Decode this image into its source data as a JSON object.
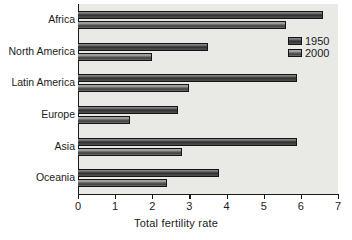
{
  "chart_data": {
    "type": "bar",
    "orientation": "horizontal",
    "title": "",
    "xlabel": "Total fertility rate",
    "ylabel": "",
    "xlim": [
      0,
      7
    ],
    "xticks": [
      0,
      1,
      2,
      3,
      4,
      5,
      6,
      7
    ],
    "grid": false,
    "legend_position": "upper right",
    "categories": [
      "Africa",
      "North America",
      "Latin America",
      "Europe",
      "Asia",
      "Oceania"
    ],
    "series": [
      {
        "name": "1950",
        "values": [
          6.6,
          3.5,
          5.9,
          2.7,
          5.9,
          3.8
        ]
      },
      {
        "name": "2000",
        "values": [
          5.6,
          2.0,
          3.0,
          1.4,
          2.8,
          2.4
        ]
      }
    ]
  },
  "legend": {
    "entries": [
      {
        "label": "1950",
        "swatch": "legend-swatch-1950"
      },
      {
        "label": "2000",
        "swatch": "legend-swatch-2000"
      }
    ]
  },
  "axis": {
    "x_tick_labels": [
      "0",
      "1",
      "2",
      "3",
      "4",
      "5",
      "6",
      "7"
    ],
    "x_axis_title": "Total fertility rate"
  },
  "colors": {
    "plot_background": "#e9e9e6",
    "figure_background": "#ffffff",
    "axis": "#1a1a1a",
    "bar_1950": "#3a3a3a",
    "bar_2000": "#4a4a4a",
    "text": "#1a1a1a"
  }
}
